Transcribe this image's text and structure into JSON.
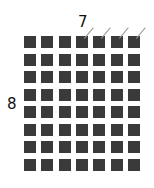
{
  "diagram": {
    "columns": 7,
    "rows": 8,
    "column_count_label": "7",
    "row_count_label": "8",
    "square_color": "#3a3a3a",
    "tick_color": "#9a9a9a",
    "ticked_columns": [
      3,
      4,
      5,
      6
    ],
    "pitch_x": 17.3,
    "pitch_y": 17.5
  }
}
